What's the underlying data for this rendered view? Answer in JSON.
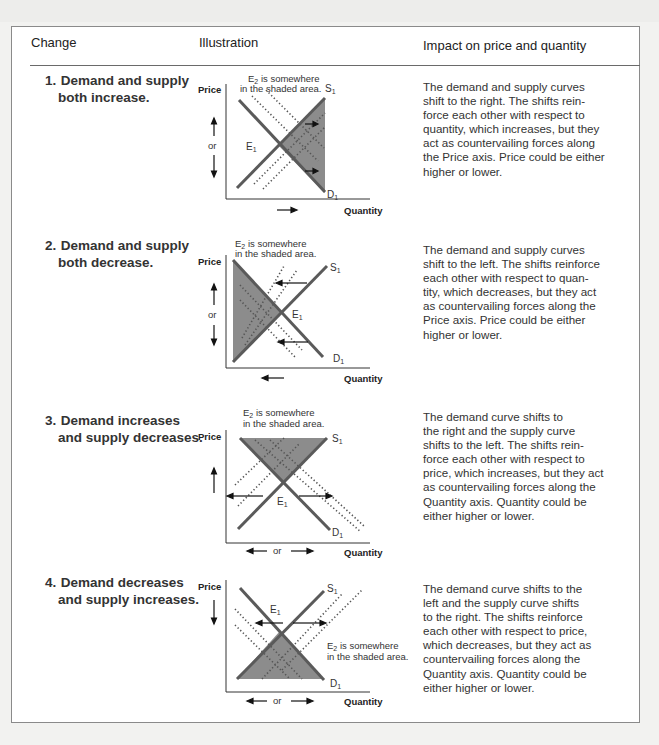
{
  "table": {
    "headers": {
      "change": "Change",
      "illustration": "Illustration",
      "impact": "Impact on price and quantity"
    },
    "rows": [
      {
        "number": "1.",
        "change_line1": "Demand and supply",
        "change_line2": "both increase.",
        "chart": {
          "annotation_line1": "E",
          "annotation_sub": "2",
          "annotation_rest1": " is somewhere",
          "annotation_line2": "in the shaded area.",
          "supply_label": "S",
          "demand_label": "D",
          "equilibrium_label": "E",
          "curve_sub": "1",
          "y_axis": "Price",
          "x_axis": "Quantity",
          "or": "or",
          "price_direction": "up or down",
          "quantity_direction": "right",
          "shift_demand": "right",
          "shift_supply": "right"
        },
        "impact_lines": [
          "The demand and supply curves",
          "shift to the right. The shifts rein-",
          "force each other with respect to",
          "quantity, which increases, but they",
          "act as countervailing forces along",
          "the Price axis. Price could be either",
          "higher or lower."
        ]
      },
      {
        "number": "2.",
        "change_line1": "Demand and supply",
        "change_line2": "both decrease.",
        "chart": {
          "annotation_line1": "E",
          "annotation_sub": "2",
          "annotation_rest1": " is somewhere",
          "annotation_line2": "in the shaded area.",
          "supply_label": "S",
          "demand_label": "D",
          "equilibrium_label": "E",
          "curve_sub": "1",
          "y_axis": "Price",
          "x_axis": "Quantity",
          "or": "or",
          "price_direction": "up or down",
          "quantity_direction": "left",
          "shift_demand": "left",
          "shift_supply": "left"
        },
        "impact_lines": [
          "The demand and supply curves",
          "shift to the left. The shifts reinforce",
          "each other with respect to quan-",
          "tity, which decreases, but they act",
          "as countervailing forces along the",
          "Price axis. Price could be either",
          "higher or lower."
        ]
      },
      {
        "number": "3.",
        "change_line1": "Demand increases",
        "change_line2": "and supply decreases.",
        "chart": {
          "annotation_line1": "E",
          "annotation_sub": "2",
          "annotation_rest1": " is somewhere",
          "annotation_line2": "in the shaded area.",
          "supply_label": "S",
          "demand_label": "D",
          "equilibrium_label": "E",
          "curve_sub": "1",
          "y_axis": "Price",
          "x_axis": "Quantity",
          "or": "or",
          "price_direction": "up",
          "quantity_direction": "left or right",
          "shift_demand": "right",
          "shift_supply": "left"
        },
        "impact_lines": [
          "The demand curve shifts to",
          "the right and the supply curve",
          "shifts to the left. The shifts rein-",
          "force each other with respect to",
          "price, which increases, but they act",
          "as countervailing forces along the",
          "Quantity axis. Quantity could be",
          "either higher or lower."
        ]
      },
      {
        "number": "4.",
        "change_line1": "Demand decreases",
        "change_line2": "and supply increases.",
        "chart": {
          "annotation_line1": "E",
          "annotation_sub": "2",
          "annotation_rest1": " is somewhere",
          "annotation_line2": "in the shaded area.",
          "supply_label": "S",
          "demand_label": "D",
          "equilibrium_label": "E",
          "curve_sub": "1",
          "y_axis": "Price",
          "x_axis": "Quantity",
          "or": "or",
          "price_direction": "down",
          "quantity_direction": "left or right",
          "shift_demand": "left",
          "shift_supply": "right"
        },
        "impact_lines": [
          "The demand curve shifts to the",
          "left and the supply curve shifts",
          "to the right. The shifts reinforce",
          "each other with respect to price,",
          "which decreases, but they act as",
          "countervailing forces along the",
          "Quantity axis. Quantity could be",
          "either higher or lower."
        ]
      }
    ]
  },
  "colors": {
    "curve": "#5a5a5a",
    "shade": "#8c8c8c",
    "dots": "#555555",
    "border": "#8a8a8a",
    "background": "#f2f2f0"
  }
}
